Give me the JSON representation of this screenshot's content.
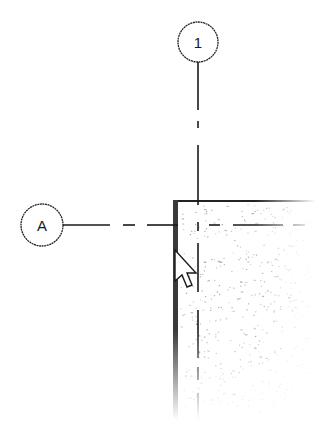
{
  "diagram": {
    "type": "architectural-grid-plan",
    "grid_lines": [
      {
        "id": "grid-1",
        "label": "1",
        "orientation": "vertical"
      },
      {
        "id": "grid-A",
        "label": "A",
        "orientation": "horizontal"
      }
    ],
    "wall": {
      "fill": "stipple (concrete)",
      "edge_color": "#333333"
    },
    "cursor": {
      "icon": "arrow-cursor-icon"
    },
    "colors": {
      "line": "#1a1a1a",
      "wall_edge": "#3a3a3a",
      "background": "#ffffff",
      "stipple": "#888888"
    }
  }
}
